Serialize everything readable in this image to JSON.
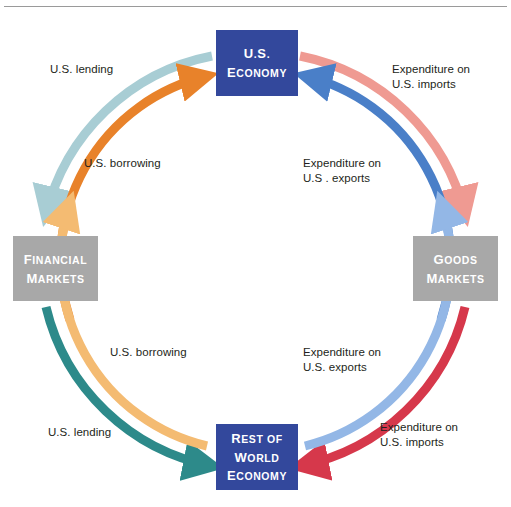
{
  "diagram": {
    "type": "circular-flow",
    "rule_present": true
  },
  "nodes": {
    "us_economy": {
      "id": "us-economy",
      "lines": [
        "U.S.",
        "Economy"
      ],
      "color": "#33489c",
      "text_color": "#ffffff",
      "position": "top"
    },
    "row_economy": {
      "id": "rest-of-world-economy",
      "lines": [
        "Rest of",
        "World",
        "Economy"
      ],
      "color": "#33489c",
      "text_color": "#ffffff",
      "position": "bottom"
    },
    "financial_markets": {
      "id": "financial-markets",
      "lines": [
        "Financial",
        "Markets"
      ],
      "color": "#a8a8a8",
      "text_color": "#ffffff",
      "position": "left"
    },
    "goods_markets": {
      "id": "goods-markets",
      "lines": [
        "Goods",
        "Markets"
      ],
      "color": "#a8a8a8",
      "text_color": "#ffffff",
      "position": "right"
    }
  },
  "flows": [
    {
      "id": "us-lending-top",
      "label": "U.S. lending",
      "color": "#a8cdd4",
      "from": "us_economy",
      "to": "financial_markets",
      "quadrant": "top-left",
      "ring": "outer",
      "arrow_at": "financial_markets"
    },
    {
      "id": "us-borrowing-top",
      "label": "U.S. borrowing",
      "color": "#e8822a",
      "from": "financial_markets",
      "to": "us_economy",
      "quadrant": "top-left",
      "ring": "inner",
      "arrow_at": "us_economy"
    },
    {
      "id": "expenditure-us-imports-top",
      "label": "Expenditure on\nU.S. imports",
      "color": "#ef9a92",
      "from": "us_economy",
      "to": "goods_markets",
      "quadrant": "top-right",
      "ring": "outer",
      "arrow_at": "goods_markets"
    },
    {
      "id": "expenditure-us-exports-top",
      "label": "Expenditure on\nU.S . exports",
      "color": "#4a7fc8",
      "from": "goods_markets",
      "to": "us_economy",
      "quadrant": "top-right",
      "ring": "inner",
      "arrow_at": "us_economy"
    },
    {
      "id": "us-lending-bottom",
      "label": "U.S. lending",
      "color": "#2d8a8a",
      "from": "financial_markets",
      "to": "row_economy",
      "quadrant": "bottom-left",
      "ring": "outer",
      "arrow_at": "row_economy"
    },
    {
      "id": "us-borrowing-bottom",
      "label": "U.S. borrowing",
      "color": "#f4bb72",
      "from": "row_economy",
      "to": "financial_markets",
      "quadrant": "bottom-left",
      "ring": "inner",
      "arrow_at": "financial_markets"
    },
    {
      "id": "expenditure-us-imports-bottom",
      "label": "Expenditure on\nU.S. imports",
      "color": "#d6384b",
      "from": "goods_markets",
      "to": "row_economy",
      "quadrant": "bottom-right",
      "ring": "outer",
      "arrow_at": "row_economy"
    },
    {
      "id": "expenditure-us-exports-bottom",
      "label": "Expenditure on\nU.S.  exports",
      "color": "#93b7e6",
      "from": "row_economy",
      "to": "goods_markets",
      "quadrant": "bottom-right",
      "ring": "inner",
      "arrow_at": "goods_markets"
    }
  ],
  "colors": {
    "node_blue": "#33489c",
    "node_gray": "#a8a8a8",
    "text_dark": "#231f20",
    "rule": "#9a9a9a",
    "background": "#ffffff"
  }
}
